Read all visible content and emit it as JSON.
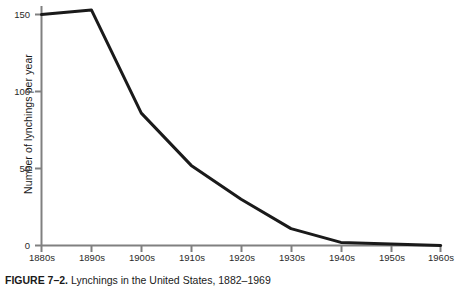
{
  "figure": {
    "caption_label": "FIGURE 7–2.",
    "caption_text": " Lynchings in the United States, 1882–1969",
    "line_color": "#1a1a1a",
    "axis_color": "#808080",
    "background_color": "#ffffff"
  },
  "chart_data": {
    "type": "line",
    "title": "Lynchings in the United States, 1882–1969",
    "xlabel": "",
    "ylabel": "Number of lynchings per year",
    "categories": [
      "1880s",
      "1890s",
      "1900s",
      "1910s",
      "1920s",
      "1930s",
      "1940s",
      "1950s",
      "1960s"
    ],
    "values": [
      150,
      153,
      86,
      52,
      30,
      11,
      2,
      1,
      0
    ],
    "series": [
      {
        "name": "Lynchings per year",
        "values": [
          150,
          153,
          86,
          52,
          30,
          11,
          2,
          1,
          0
        ]
      }
    ],
    "ylim": [
      0,
      160
    ],
    "yticks": [
      0,
      50,
      100,
      150
    ],
    "ytick_labels": [
      "0",
      "50",
      "100",
      "150"
    ],
    "xtick_labels": [
      "1880s",
      "1890s",
      "1900s",
      "1910s",
      "1920s",
      "1930s",
      "1940s",
      "1950s",
      "1960s"
    ],
    "grid": false,
    "legend": "none"
  }
}
